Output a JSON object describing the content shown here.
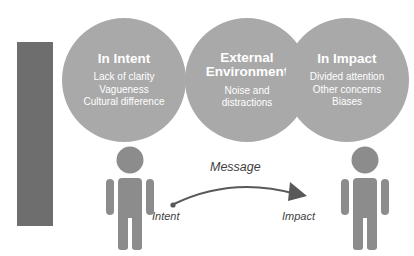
{
  "diagram": {
    "title_bar": {
      "label": "Barriers",
      "bar_color": "#6e6e6e",
      "text_color": "#ffffff"
    },
    "circle_color": "#a9a9a9",
    "person_color": "#8c8c8c",
    "arrow_color": "#595959",
    "background": "#ffffff",
    "circles": [
      {
        "id": "in-intent",
        "title": "In Intent",
        "items": "Lack of clarity\nVagueness\nCultural difference"
      },
      {
        "id": "external-environment",
        "title": "External\nEnvironment",
        "items": "Noise and\ndistractions"
      },
      {
        "id": "in-impact",
        "title": "In Impact",
        "items": "Divided attention\nOther concerns\nBiases"
      }
    ],
    "flow": {
      "arrow_label": "Message",
      "source_label": "Intent",
      "target_label": "Impact"
    },
    "actors": [
      {
        "id": "sender",
        "role": "Intent"
      },
      {
        "id": "receiver",
        "role": "Impact"
      }
    ]
  }
}
